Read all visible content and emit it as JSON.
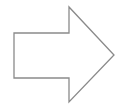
{
  "diagram": {
    "shape": "right-arrow",
    "stroke_color": "#8a8a8a",
    "fill_color": "#ffffff",
    "background": "#ffffff"
  }
}
